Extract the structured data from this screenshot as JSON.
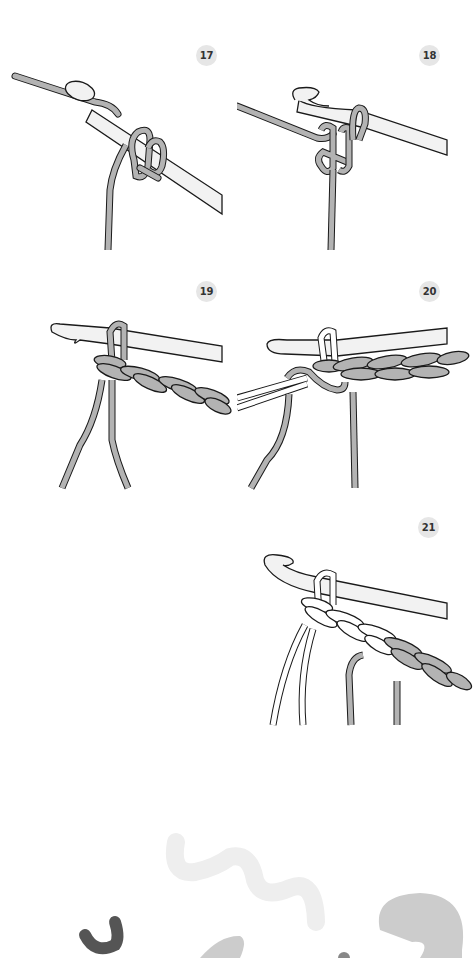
{
  "steps": [
    {
      "number": "17"
    },
    {
      "number": "18"
    },
    {
      "number": "19"
    },
    {
      "number": "20"
    },
    {
      "number": "21"
    }
  ],
  "colors": {
    "yarn": "#b3b3b3",
    "yarn_light": "#ffffff",
    "hook": "#f2f2f2",
    "outline": "#1a1a1a",
    "badge_bg": "#e6e6e6",
    "badge_text": "#333333",
    "deco_light": "#eeeeee",
    "deco_mid": "#cccccc",
    "deco_dark": "#555555"
  }
}
